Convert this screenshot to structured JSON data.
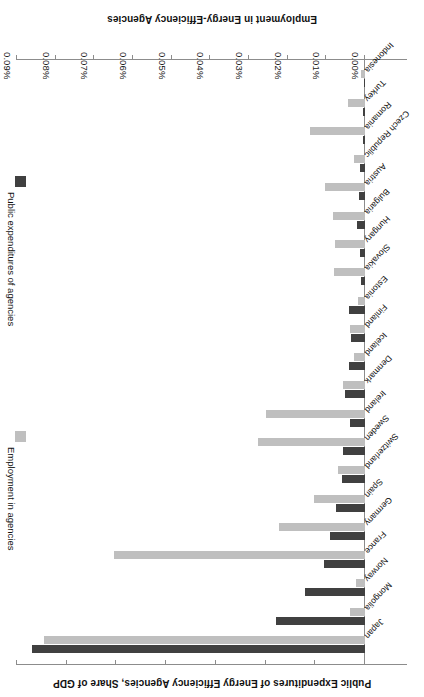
{
  "chart_data": {
    "type": "bar",
    "orientation": "horizontal",
    "rotated_180": true,
    "title": "",
    "categories": [
      "Japan",
      "Mongolia",
      "Norway",
      "France",
      "Germany",
      "Spain",
      "Switzerland",
      "Sweden",
      "Ireland",
      "Denmark",
      "Iceland",
      "Finland",
      "Estonia",
      "Slovakia",
      "Hungary",
      "Bulgaria",
      "Austria",
      "Czech Republic",
      "Romania",
      "Turkey",
      "Indonesia"
    ],
    "series": [
      {
        "name": "Public expenditures of agencies",
        "color": "#404040",
        "axis": "expenditure",
        "unit": "% of GDP",
        "values": [
          0.086,
          0.023,
          0.0155,
          0.0106,
          0.0091,
          0.0074,
          0.006,
          0.0056,
          0.0038,
          0.0053,
          0.0042,
          0.0036,
          0.0042,
          0.0011,
          0.0013,
          0.002,
          0.0016,
          0.0013,
          0.0006,
          0.0004,
          0.0002
        ]
      },
      {
        "name": "Employment in agencies",
        "color": "#bfbfbf",
        "axis": "employment",
        "unit": "persons",
        "values": [
          1290,
          60,
          35,
          1010,
          345,
          205,
          110,
          430,
          400,
          90,
          45,
          60,
          30,
          125,
          120,
          130,
          160,
          45,
          220,
          70,
          15
        ]
      }
    ],
    "employment_axis": {
      "label": "Employment in Energy-Efficiency Agencies",
      "min": 0,
      "max": 1400,
      "step": 200,
      "tick_labels": [
        "0",
        "200",
        "400",
        "600",
        "800",
        "1,000",
        "1,200",
        "1,400"
      ]
    },
    "expenditure_axis": {
      "label": "Public Expenditures of Energy Efficiency Agencies, Share of GDP",
      "min": 0,
      "max": 0.09,
      "step": 0.01,
      "tick_labels": [
        "0.00%",
        "0.01%",
        "0.02%",
        "0.03%",
        "0.04%",
        "0.05%",
        "0.06%",
        "0.07%",
        "0.08%",
        "0.09%"
      ]
    },
    "legend": {
      "position": "left",
      "entries": [
        {
          "label": "Public expenditures of agencies",
          "color": "#404040"
        },
        {
          "label": "Employment in agencies",
          "color": "#bfbfbf"
        }
      ]
    },
    "grid": false
  }
}
